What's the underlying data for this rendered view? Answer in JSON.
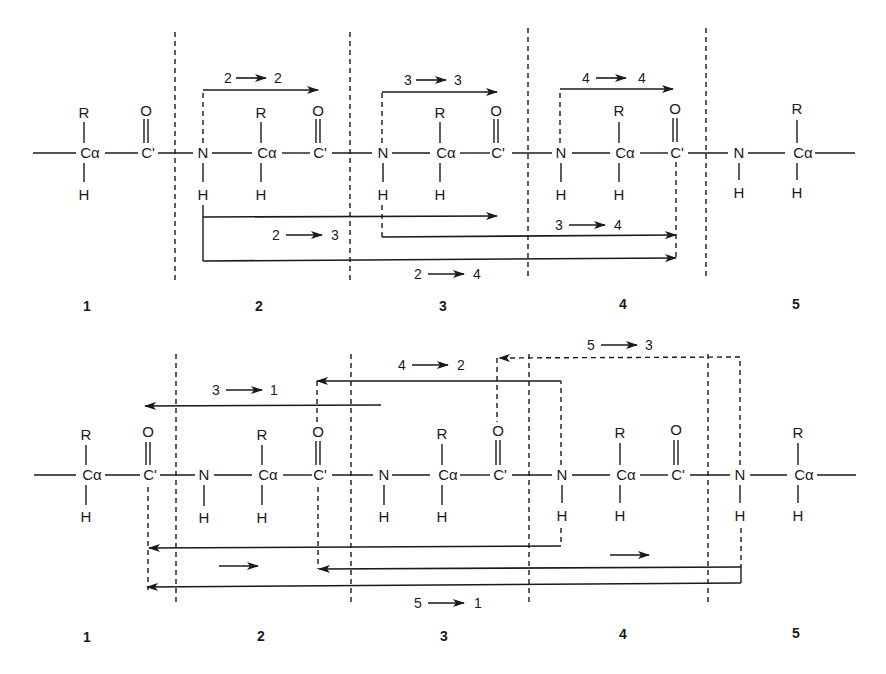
{
  "atoms": {
    "r": "R",
    "h": "H",
    "o": "O",
    "ca": "Cα",
    "cp": "C'",
    "n": "N"
  },
  "top_panel": {
    "residue_numbers": [
      "1",
      "2",
      "3",
      "4",
      "5"
    ],
    "transfer_labels": {
      "t22": {
        "from": "2",
        "to": "2"
      },
      "t33": {
        "from": "3",
        "to": "3"
      },
      "t44": {
        "from": "4",
        "to": "4"
      },
      "t23": {
        "from": "2",
        "to": "3"
      },
      "t34": {
        "from": "3",
        "to": "4"
      },
      "t24": {
        "from": "2",
        "to": "4"
      }
    }
  },
  "bottom_panel": {
    "residue_numbers": [
      "1",
      "2",
      "3",
      "4",
      "5"
    ],
    "transfer_labels": {
      "t31": {
        "from": "3",
        "to": "1"
      },
      "t42": {
        "from": "4",
        "to": "2"
      },
      "t53": {
        "from": "5",
        "to": "3"
      },
      "t51": {
        "from": "5",
        "to": "1"
      }
    }
  }
}
